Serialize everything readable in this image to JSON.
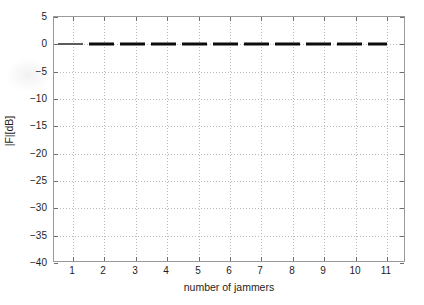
{
  "figure": {
    "background_color": "#ffffff",
    "axis_color": "#9a9a9a",
    "grid_color": "#b9b9b9",
    "series_color": "#0c0c0c"
  },
  "chart_data": {
    "type": "line",
    "title": "",
    "xlabel": "number of jammers",
    "ylabel": "|F|[dB]",
    "xlim": [
      0.4,
      11.6
    ],
    "ylim": [
      -40,
      5
    ],
    "grid": true,
    "legend": null,
    "line_style": "dashed",
    "line_width_px": 3,
    "x_ticks": [
      1,
      2,
      3,
      4,
      5,
      6,
      7,
      8,
      9,
      10,
      11
    ],
    "x_tick_labels": [
      "1",
      "2",
      "3",
      "4",
      "5",
      "6",
      "7",
      "8",
      "9",
      "10",
      "11"
    ],
    "y_ticks": [
      5,
      0,
      -5,
      -10,
      -15,
      -20,
      -25,
      -30,
      -35,
      -40
    ],
    "y_tick_labels": [
      "5",
      "0",
      "-5",
      "-10",
      "-15",
      "-20",
      "-25",
      "-30",
      "-35",
      "-40"
    ],
    "series": [
      {
        "name": "|F|[dB]",
        "x": [
          1,
          2,
          3,
          4,
          5,
          6,
          7,
          8,
          9,
          10,
          11
        ],
        "values": [
          0,
          0,
          0,
          0,
          0,
          0,
          0,
          0,
          0,
          0,
          0
        ]
      }
    ]
  }
}
